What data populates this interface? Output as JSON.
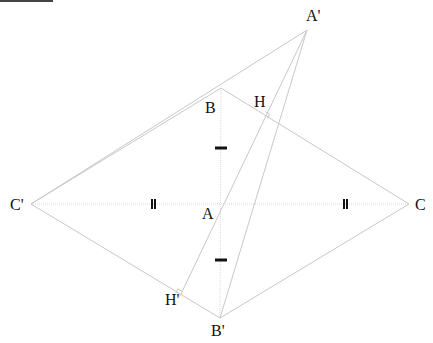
{
  "diagram": {
    "type": "geometry-construction",
    "colors": {
      "line": "#c8c8c8",
      "dotted": "#d8d8d8",
      "tick": "#111111",
      "label": "#111111"
    },
    "points": {
      "A": {
        "label": "A",
        "x": 221,
        "y": 204
      },
      "B": {
        "label": "B",
        "x": 221,
        "y": 88
      },
      "C": {
        "label": "C",
        "x": 409,
        "y": 204
      },
      "A'": {
        "label": "A'",
        "x": 307,
        "y": 30
      },
      "B'": {
        "label": "B'",
        "x": 220,
        "y": 318
      },
      "C'": {
        "label": "C'",
        "x": 31,
        "y": 204
      },
      "H": {
        "label": "H",
        "x": 263,
        "y": 116
      },
      "H'": {
        "label": "H'",
        "x": 180,
        "y": 296
      }
    },
    "labels": [
      {
        "text": "A'",
        "x": 306,
        "y": 8
      },
      {
        "text": "B",
        "x": 205,
        "y": 100
      },
      {
        "text": "H",
        "x": 254,
        "y": 94
      },
      {
        "text": "C'",
        "x": 10,
        "y": 197
      },
      {
        "text": "A",
        "x": 202,
        "y": 206
      },
      {
        "text": "C",
        "x": 415,
        "y": 197
      },
      {
        "text": "H'",
        "x": 165,
        "y": 292
      },
      {
        "text": "B'",
        "x": 211,
        "y": 323
      }
    ],
    "segments": [
      [
        "B",
        "C"
      ],
      [
        "C",
        "B'"
      ],
      [
        "B'",
        "C'"
      ],
      [
        "C'",
        "A'"
      ],
      [
        "C'",
        "B"
      ],
      [
        "A'",
        "B'"
      ],
      [
        "A'",
        "H'"
      ]
    ],
    "dotted_segments": [
      [
        "C'",
        "C"
      ],
      [
        "B",
        "B'"
      ]
    ],
    "tick_marks": [
      {
        "kind": "single",
        "x": 221,
        "y": 148
      },
      {
        "kind": "single",
        "x": 221,
        "y": 260
      },
      {
        "kind": "double",
        "x": 153,
        "y": 204
      },
      {
        "kind": "double",
        "x": 345,
        "y": 204
      }
    ],
    "right_angles": [
      "H",
      "H'"
    ]
  }
}
